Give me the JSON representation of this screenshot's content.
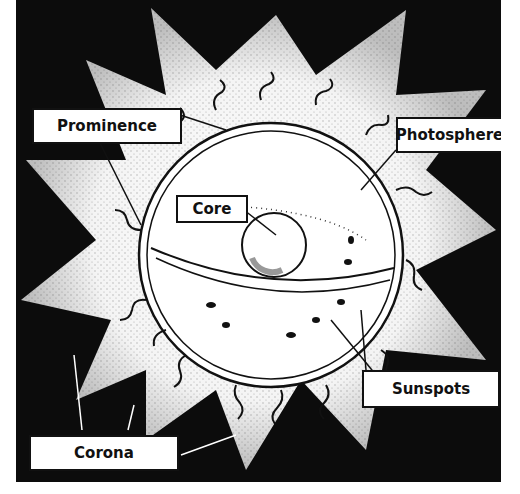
{
  "diagram": {
    "labels": {
      "prominence": "Prominence",
      "photosphere": "Photosphere",
      "core": "Core",
      "sunspots": "Sunspots",
      "corona": "Corona"
    },
    "colors": {
      "background": "#0c0c0c",
      "corona": "#ffffff",
      "outline": "#111111"
    }
  }
}
